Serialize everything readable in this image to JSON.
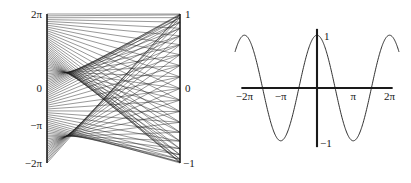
{
  "figure": {
    "background_color": "#ffffff",
    "ink_color": "#1a1a1a",
    "panels": [
      {
        "name": "line-family-panel",
        "position": "left"
      },
      {
        "name": "cosine-curve-panel",
        "position": "right"
      }
    ]
  },
  "left_panel": {
    "theta_axis": {
      "name": "theta-axis",
      "position": "left",
      "tick_labels": [
        "2π",
        "0",
        "−π",
        "−2π"
      ],
      "tick_values": [
        6.2832,
        0,
        -3.1416,
        -6.2832
      ],
      "axis_min": -6.2832,
      "axis_max": 6.2832
    },
    "value_axis": {
      "name": "cosine-value-axis",
      "position": "right",
      "tick_labels": [
        "1",
        "0",
        "−1"
      ],
      "tick_values": [
        1,
        0,
        -1
      ],
      "axis_min": -1,
      "axis_max": 1
    },
    "line_family": {
      "description": "chords joining theta on the left axis to cos(theta) on the right axis",
      "line_count": 81,
      "envelope": "caustic"
    }
  },
  "right_panel": {
    "x_axis": {
      "name": "x-axis",
      "tick_labels": [
        "−2π",
        "−π",
        "π",
        "2π"
      ],
      "tick_values": [
        -6.2832,
        -3.1416,
        3.1416,
        6.2832
      ],
      "axis_min": -7.1,
      "axis_max": 7.1
    },
    "y_axis": {
      "name": "y-axis",
      "tick_labels": [
        "1",
        "−1"
      ],
      "tick_values": [
        1,
        -1
      ],
      "axis_min": -1.25,
      "axis_max": 1.25
    }
  },
  "chart_data": [
    {
      "type": "line",
      "name": "line-family-chord-plot",
      "title": "",
      "xlabel": "",
      "ylabel": "",
      "xlim": [
        -1,
        1
      ],
      "ylim": [
        -6.2832,
        6.2832
      ],
      "grid": false,
      "legend": null,
      "left_axis_ticks": {
        "labels": [
          "2π",
          "0",
          "−π",
          "−2π"
        ],
        "values": [
          6.2832,
          0,
          -3.1416,
          -6.2832
        ]
      },
      "right_axis_ticks": {
        "labels": [
          "1",
          "0",
          "−1"
        ],
        "values": [
          1,
          0,
          -1
        ]
      },
      "description": "A family of straight chords. Each chord starts at height theta on the left axis (theta running from -2pi to 2pi) and ends at height cos(theta) on the right axis, creating a caustic envelope with cusps near theta = +/- pi.",
      "chord_count": 81,
      "theta_start": -6.2832,
      "theta_end": 6.2832,
      "endpoint_rule": "y_left = theta, y_right = cos(theta)"
    },
    {
      "type": "line",
      "name": "cosine-curve",
      "title": "",
      "xlabel": "",
      "ylabel": "",
      "xlim": [
        -7.1,
        7.1
      ],
      "ylim": [
        -1.25,
        1.25
      ],
      "grid": false,
      "legend": null,
      "function": "y = cos(x)",
      "x_ticks": {
        "labels": [
          "−2π",
          "−π",
          "π",
          "2π"
        ],
        "values": [
          -6.2832,
          -3.1416,
          3.1416,
          6.2832
        ]
      },
      "y_ticks": {
        "labels": [
          "1",
          "−1"
        ],
        "values": [
          1,
          -1
        ]
      },
      "x": [
        -7.1,
        -6.2832,
        -4.7124,
        -3.1416,
        -1.5708,
        0,
        1.5708,
        3.1416,
        4.7124,
        6.2832,
        7.1
      ],
      "values": [
        0.58,
        1,
        0,
        -1,
        0,
        1,
        0,
        -1,
        0,
        1,
        0.58
      ],
      "maxima_at": [
        -6.2832,
        0,
        6.2832
      ],
      "minima_at": [
        -3.1416,
        3.1416
      ],
      "zeros_at": [
        -4.7124,
        -1.5708,
        1.5708,
        4.7124
      ]
    }
  ]
}
